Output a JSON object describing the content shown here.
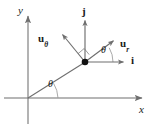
{
  "figure": {
    "name": "polar-unit-vectors-diagram",
    "type": "vector-diagram",
    "width": 161,
    "height": 127,
    "background_color": "#ffffff",
    "line_color": "#6e6e6e",
    "text_color": "#1a1a1a",
    "point_color": "#111111"
  },
  "axes": {
    "x_label": "x",
    "y_label": "y",
    "origin": {
      "x": 28,
      "y": 98
    },
    "x_axis": {
      "from_x": 4,
      "to_x": 148,
      "y": 98,
      "arrow": "right"
    },
    "y_axis": {
      "x": 28,
      "from_y": 124,
      "to_y": 11,
      "arrow": "up"
    }
  },
  "point": {
    "label": "",
    "x": 85,
    "y": 62,
    "radius": 3.2
  },
  "radial_line": {
    "from": {
      "x": 28,
      "y": 98
    },
    "to": {
      "x": 85,
      "y": 62
    }
  },
  "vectors": [
    {
      "id": "u-theta",
      "label_base": "u",
      "label_sub": "θ",
      "label_x": 38,
      "label_y": 34,
      "tip": {
        "x": 59,
        "y": 31
      }
    },
    {
      "id": "u-r",
      "label_base": "u",
      "label_sub": "r",
      "label_x": 120,
      "label_y": 39,
      "tip": {
        "x": 117,
        "y": 38
      }
    },
    {
      "id": "j-hat",
      "label_base": "j",
      "label_sub": "",
      "label_x": 82,
      "label_y": 6,
      "tip": {
        "x": 85,
        "y": 17
      }
    },
    {
      "id": "i-hat",
      "label_base": "i",
      "label_sub": "",
      "label_x": 131,
      "label_y": 55,
      "tip": {
        "x": 126,
        "y": 62
      }
    }
  ],
  "angles": [
    {
      "id": "theta-at-point",
      "label": "θ",
      "label_x": 102,
      "label_y": 50
    },
    {
      "id": "theta-at-origin",
      "label": "θ",
      "label_x": 49,
      "label_y": 84
    }
  ],
  "right_angle_marker": {
    "present": true,
    "at": {
      "x": 85,
      "y": 62
    },
    "between": [
      "u-theta",
      "u-r"
    ]
  }
}
